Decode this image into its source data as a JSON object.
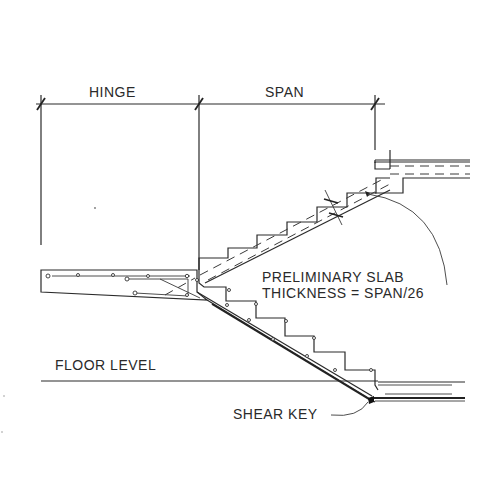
{
  "drawing": {
    "title": "Stair section with hinge and span",
    "dimensions": {
      "hinge_label": "HINGE",
      "span_label": "SPAN"
    },
    "annotations": {
      "slab_line1": "PRELIMINARY SLAB",
      "slab_line2": "THICKNESS = SPAN/26",
      "floor_level": "FLOOR LEVEL",
      "shear_key": "SHEAR KEY"
    },
    "colors": {
      "ink": "#2a2a2a",
      "paper": "#ffffff"
    }
  }
}
